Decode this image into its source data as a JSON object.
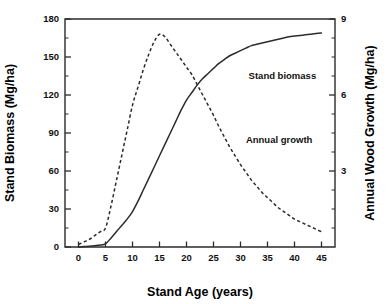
{
  "chart_data": {
    "type": "line",
    "title": "",
    "subtitle": "",
    "xlabel": "Stand Age (years)",
    "ylabel": "Stand Biomass (Mg/ha)",
    "y2label": "Annual Wood Growth (Mg/ha)",
    "xlim": [
      -2.5,
      47.5
    ],
    "ylim": [
      0,
      180
    ],
    "y2lim": [
      0,
      9
    ],
    "xticks": [
      0,
      5,
      10,
      15,
      20,
      25,
      30,
      35,
      40,
      45
    ],
    "xticklabels": [
      "0",
      "5",
      "10",
      "15",
      "20",
      "25",
      "30",
      "35",
      "40",
      "45"
    ],
    "yticks": [
      0,
      30,
      60,
      90,
      120,
      150,
      180
    ],
    "yticklabels": [
      "0",
      "30",
      "60",
      "90",
      "120",
      "150",
      "180"
    ],
    "yminorticks": [
      15,
      45,
      75,
      105,
      135,
      165
    ],
    "y2ticks": [
      3,
      6,
      9
    ],
    "y2ticklabels": [
      "3",
      "6",
      "9"
    ],
    "y2minorticks": [
      0.75,
      1.5,
      2.25,
      3.75,
      4.5,
      5.25,
      6.75,
      7.5,
      8.25
    ],
    "grid": false,
    "legend_position": "inline-annotations",
    "series": [
      {
        "name": "Stand biomass",
        "style": "solid",
        "axis": "left",
        "units": "Mg/ha",
        "x": [
          0,
          1,
          2,
          3,
          4,
          5,
          6,
          7,
          8,
          9,
          10,
          11,
          12,
          13,
          14,
          15,
          16,
          17,
          18,
          19,
          20,
          21,
          22,
          23,
          24,
          25,
          26,
          27,
          28,
          29,
          30,
          31,
          32,
          33,
          34,
          35,
          36,
          37,
          38,
          39,
          40,
          41,
          42,
          43,
          44,
          45
        ],
        "values": [
          0,
          0.3,
          0.6,
          1.0,
          1.5,
          2.5,
          7,
          12,
          17,
          22,
          28,
          36,
          45,
          54,
          63,
          72,
          81,
          90,
          99,
          108,
          116,
          122,
          128,
          133,
          137,
          141,
          145,
          148,
          151,
          153,
          155,
          157,
          159,
          160,
          161,
          162,
          163,
          164,
          165,
          166,
          166.5,
          167,
          167.5,
          168,
          168.5,
          169
        ]
      },
      {
        "name": "Annual growth",
        "style": "dashed",
        "axis": "right",
        "units": "Mg/ha",
        "x": [
          0,
          1,
          2,
          3,
          4,
          5,
          6,
          7,
          8,
          9,
          10,
          11,
          12,
          13,
          14,
          15,
          16,
          17,
          18,
          19,
          20,
          21,
          22,
          23,
          24,
          25,
          26,
          27,
          28,
          29,
          30,
          31,
          32,
          33,
          34,
          35,
          36,
          37,
          38,
          39,
          40,
          41,
          42,
          43,
          44,
          45
        ],
        "values": [
          0.1,
          0.2,
          0.3,
          0.45,
          0.6,
          0.75,
          1.6,
          2.6,
          3.6,
          4.6,
          5.6,
          6.3,
          7.0,
          7.6,
          8.1,
          8.4,
          8.3,
          8.0,
          7.7,
          7.4,
          7.1,
          6.8,
          6.4,
          6.0,
          5.6,
          5.2,
          4.75,
          4.35,
          3.95,
          3.6,
          3.25,
          2.95,
          2.65,
          2.4,
          2.15,
          1.95,
          1.75,
          1.55,
          1.4,
          1.25,
          1.1,
          1.0,
          0.9,
          0.8,
          0.7,
          0.6
        ]
      }
    ],
    "annotations": [
      {
        "text": "Stand biomass",
        "x": 31.5,
        "y_pixel_frac": 0.262
      },
      {
        "text": "Annual growth",
        "x": 31.0,
        "y_pixel_frac": 0.545
      }
    ],
    "colors": {
      "axis": "#2b2b2b",
      "text": "#111111",
      "curve": "#2b2b2b",
      "background": "#ffffff"
    }
  }
}
